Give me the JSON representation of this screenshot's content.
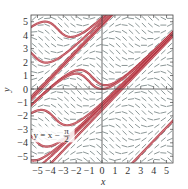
{
  "chart_data": {
    "type": "line",
    "title": "",
    "subtitle": "Slope field with solution curves",
    "xlabel": "x",
    "ylabel": "y",
    "xlim": [
      -5.5,
      5.5
    ],
    "ylim": [
      -5.5,
      5.5
    ],
    "x_ticks": [
      -5,
      -4,
      -3,
      -2,
      -1,
      0,
      1,
      2,
      3,
      4,
      5
    ],
    "y_ticks": [
      -5,
      -4,
      -3,
      -2,
      -1,
      0,
      1,
      2,
      3,
      4,
      5
    ],
    "x_tick_labels": [
      "−5",
      "−4",
      "−3",
      "−2",
      "−1",
      "0",
      "1",
      "2",
      "3",
      "4",
      "5"
    ],
    "y_tick_labels": [
      "−5",
      "−4",
      "−3",
      "−2",
      "−1",
      "0",
      "1",
      "2",
      "3",
      "4",
      "5"
    ],
    "grid": false,
    "equation": "dy/dx = sin(x − y)",
    "slope_field": {
      "spacing": 0.5,
      "segment_color": "#5a6a6a"
    },
    "series": [
      {
        "name": "y = x − π/2 − 2π",
        "kind": "line",
        "y0_at_x0": -7.854
      },
      {
        "name": "y = x − π/2",
        "kind": "line",
        "y0_at_x0": -1.5708
      },
      {
        "name": "y = x − π/2 + 2π",
        "kind": "line",
        "y0_at_x0": 4.7124
      },
      {
        "name": "solution near line A",
        "kind": "ode",
        "x0": -5.5,
        "y0": -5.3
      },
      {
        "name": "solution near line A2",
        "kind": "ode",
        "x0": -5.5,
        "y0": -6.2
      },
      {
        "name": "solution near line B",
        "kind": "ode",
        "x0": -5.5,
        "y0": -0.6
      },
      {
        "name": "solution near line B2",
        "kind": "ode",
        "x0": -5.5,
        "y0": -1.2
      },
      {
        "name": "oscillating curve 1",
        "kind": "ode",
        "x0": -5.5,
        "y0": 4.6
      },
      {
        "name": "oscillating curve 2",
        "kind": "ode",
        "x0": -5.5,
        "y0": 2.7
      },
      {
        "name": "oscillating curve 3",
        "kind": "ode",
        "x0": -5.5,
        "y0": -1.8
      },
      {
        "name": "oscillating curve 4",
        "kind": "ode",
        "x0": -5.5,
        "y0": -3.5
      },
      {
        "name": "oscillating curve 5",
        "kind": "ode",
        "x0": 0.0,
        "y0": 0.0
      }
    ],
    "curve_color": "#b5333f",
    "annotations": [
      {
        "text_main": "y = x − ",
        "text_frac_num": "π",
        "text_frac_den": "2",
        "x": -5.3,
        "y": -3.0
      }
    ]
  },
  "axes": {
    "x_title": "x",
    "y_title": "y"
  }
}
